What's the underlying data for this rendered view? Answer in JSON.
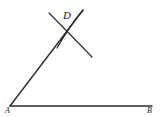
{
  "figure": {
    "background_color": "#ffffff",
    "stroke_color": "#2b2b2b",
    "label_color": "#1a1a1a",
    "width": 160,
    "height": 117,
    "labels": {
      "vertex": "A",
      "ray_endpoint": "B",
      "arc_intersection": "D"
    },
    "points": {
      "A": {
        "x": 10,
        "y": 106
      },
      "B": {
        "x": 152,
        "y": 106
      },
      "D": {
        "x": 69,
        "y": 30
      }
    },
    "segments": [
      {
        "name": "base-ray-AB",
        "from": "A",
        "to": "B",
        "x1": 10,
        "y1": 106,
        "x2": 152,
        "y2": 106,
        "stroke_width": 1.4
      },
      {
        "name": "slanted-ray-AD",
        "from": "A",
        "to": "D",
        "x1": 10,
        "y1": 106,
        "x2": 83,
        "y2": 10,
        "stroke_width": 1.4
      }
    ],
    "arcs": [
      {
        "name": "arc-left",
        "start_x": 49,
        "start_y": 13,
        "control_x": 58,
        "control_y": 30,
        "end_x": 92,
        "end_y": 57,
        "stroke_width": 1.2
      },
      {
        "name": "arc-right",
        "start_x": 83,
        "start_y": 10,
        "control_x": 74,
        "control_y": 27,
        "end_x": 57,
        "end_y": 48,
        "stroke_width": 1.2
      }
    ]
  }
}
